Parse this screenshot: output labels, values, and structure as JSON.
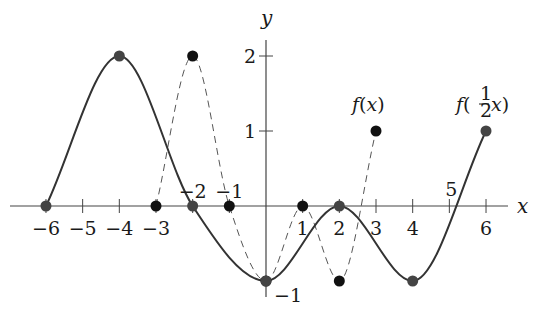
{
  "chart_data": {
    "type": "line",
    "title": "",
    "xlabel": "x",
    "ylabel": "y",
    "xlim": [
      -6.5,
      7
    ],
    "ylim": [
      -1.4,
      2.5
    ],
    "grid": false,
    "legend": "inline labels near curve endpoints",
    "x_ticks": [
      -6,
      -5,
      -4,
      -3,
      -2,
      -1,
      1,
      2,
      3,
      4,
      5,
      6
    ],
    "x_tick_labels": [
      "−6",
      "−5",
      "−4",
      "−3",
      "−2",
      "−1",
      "1",
      "2",
      "3",
      "4",
      "5",
      "6"
    ],
    "y_ticks": [
      2,
      1,
      -1
    ],
    "y_tick_labels": [
      "2",
      "1",
      "−1"
    ],
    "series": [
      {
        "name": "f(x)",
        "style": "dashed",
        "color": "#555555",
        "marker_color": "#111111",
        "x": [
          -3,
          -2,
          -1,
          0,
          1,
          2,
          3
        ],
        "y": [
          0,
          2,
          0,
          -1,
          0,
          -1,
          1
        ]
      },
      {
        "name": "f(½x)",
        "style": "solid",
        "color": "#333333",
        "marker_color": "#444444",
        "x": [
          -6,
          -4,
          -2,
          0,
          2,
          4,
          6
        ],
        "y": [
          0,
          2,
          0,
          -1,
          0,
          -1,
          1
        ]
      }
    ],
    "annotations": [
      {
        "text": "f(x)",
        "x": 3,
        "y": 1.3
      },
      {
        "text": "f(½x)",
        "x": 6,
        "y": 1.3
      }
    ]
  },
  "labels": {
    "x_axis": "x",
    "y_axis": "y",
    "series_f": "f(x)",
    "series_g_prefix": "f(",
    "series_g_frac_num": "1",
    "series_g_frac_den": "2",
    "series_g_suffix": "x)"
  }
}
